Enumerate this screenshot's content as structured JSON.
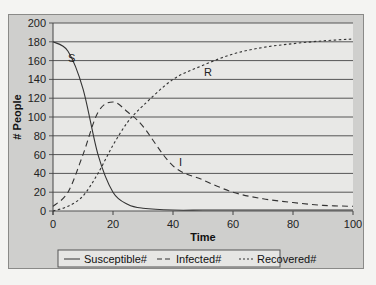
{
  "chart_data": {
    "type": "line",
    "title": "",
    "xlabel": "Time",
    "ylabel": "# People",
    "xlim": [
      0,
      100
    ],
    "ylim": [
      0,
      200
    ],
    "x_ticks": [
      "0",
      "20",
      "40",
      "60",
      "80",
      "100"
    ],
    "y_ticks": [
      "0",
      "20",
      "40",
      "60",
      "80",
      "100",
      "120",
      "140",
      "160",
      "180",
      "200"
    ],
    "grid": "horizontal",
    "legend_position": "bottom",
    "x": [
      0,
      5,
      10,
      15,
      20,
      25,
      30,
      40,
      50,
      60,
      70,
      80,
      90,
      100
    ],
    "series": [
      {
        "name": "Susceptible#",
        "label": "S",
        "style": "solid",
        "values": [
          180,
          170,
          130,
          60,
          20,
          7,
          3,
          1,
          1,
          1,
          1,
          1,
          1,
          1
        ]
      },
      {
        "name": "Infected#",
        "label": "I",
        "style": "dashed",
        "values": [
          5,
          20,
          60,
          105,
          116,
          105,
          90,
          48,
          33,
          20,
          13,
          9,
          6,
          5
        ]
      },
      {
        "name": "Recovered#",
        "label": "R",
        "style": "dotted",
        "values": [
          0,
          5,
          16,
          40,
          70,
          95,
          112,
          140,
          155,
          167,
          174,
          178,
          181,
          183
        ]
      }
    ]
  },
  "labels": {
    "xlabel": "Time",
    "ylabel": "# People",
    "curve_S": "S",
    "curve_I": "I",
    "curve_R": "R",
    "legend": [
      "Susceptible#",
      "Infected#",
      "Recovered#"
    ]
  }
}
